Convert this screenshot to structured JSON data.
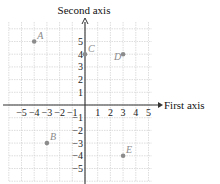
{
  "chart_data": {
    "type": "scatter",
    "title": "",
    "xlabel": "First axis",
    "ylabel": "Second axis",
    "xlim": [
      -6,
      5.5
    ],
    "ylim": [
      -6,
      6
    ],
    "grid": true,
    "x_ticks": [
      "-5",
      "-4",
      "-3",
      "-2",
      "-1",
      "1",
      "2",
      "3",
      "4",
      "5"
    ],
    "y_ticks": [
      "5",
      "4",
      "3",
      "2",
      "1",
      "-1",
      "-2",
      "-3",
      "-4",
      "-5"
    ],
    "points": [
      {
        "label": "A",
        "x": -4,
        "y": 5
      },
      {
        "label": "B",
        "x": -3,
        "y": -3
      },
      {
        "label": "C",
        "x": 0,
        "y": 4
      },
      {
        "label": "D",
        "x": 3,
        "y": 4
      },
      {
        "label": "E",
        "x": 3,
        "y": -4
      }
    ],
    "colors": {
      "grid": "#d0d0d0",
      "axis": "#333333",
      "point": "#8c8c8c"
    }
  }
}
